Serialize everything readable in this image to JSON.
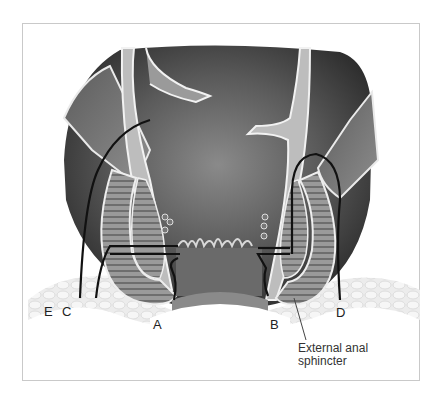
{
  "figure": {
    "labels": [
      {
        "id": "E",
        "text": "E"
      },
      {
        "id": "C",
        "text": "C"
      },
      {
        "id": "A",
        "text": "A"
      },
      {
        "id": "B",
        "text": "B"
      },
      {
        "id": "D",
        "text": "D"
      }
    ],
    "callout": {
      "line1": "External anal",
      "line2": "sphincter"
    },
    "colors": {
      "frame_border": "#c9c9c9",
      "tract_line": "#111111",
      "lumen_dark": "#3a3a3a",
      "muscle": "#8a8a8a",
      "fat": "#e6e6e6"
    }
  }
}
